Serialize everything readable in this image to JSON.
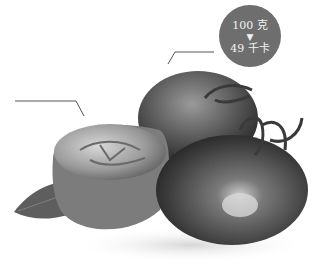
{
  "image": {
    "subject": "tomatoes",
    "description": "grayscale photo of two whole tomatoes with stems and a halved tomato on a mint leaf"
  },
  "nutrition_badge": {
    "weight": "100 克",
    "arrow": "▼",
    "calories": "49 千卡",
    "color": "#6e6e6e"
  },
  "callout_lines": [
    {
      "points": [
        [
          15,
          101
        ],
        [
          76,
          101
        ],
        [
          84,
          116
        ]
      ]
    },
    {
      "points": [
        [
          168,
          64
        ],
        [
          175,
          52
        ],
        [
          214,
          52
        ]
      ]
    }
  ]
}
